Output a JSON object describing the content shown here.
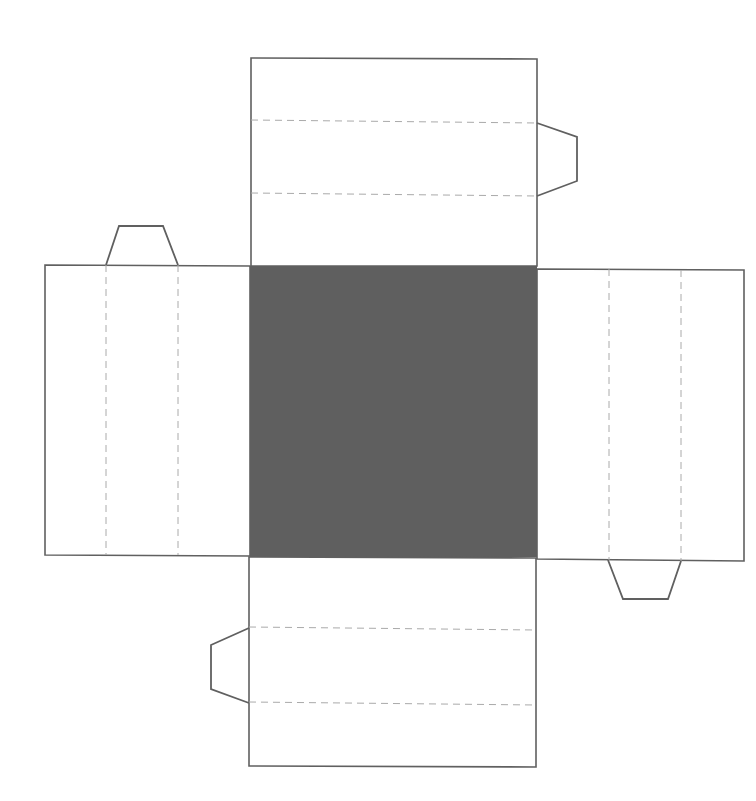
{
  "diagram": {
    "type": "box-net",
    "colors": {
      "outline": "#606060",
      "fold": "#aaaaaa",
      "base_fill": "#5f5f5f",
      "panel_fill": "#ffffff"
    },
    "base": {
      "x": 250,
      "y": 266,
      "w": 287,
      "h": 291
    },
    "panels": {
      "top": {
        "points": "251,58 537,59 537,266 251,266"
      },
      "bottom": {
        "points": "249,557 536,558 536,767 249,766"
      },
      "left": {
        "points": "45,265 250,266 250,556 45,555"
      },
      "right": {
        "points": "537,269 744,270 744,561 537,559"
      }
    },
    "folds": {
      "top": [
        "251,120 537,123",
        "251,193 537,196"
      ],
      "bottom": [
        "249,627 536,630",
        "249,702 536,705"
      ],
      "left": [
        "106,265 106,555",
        "178,265 178,555"
      ],
      "right": [
        "609,269 609,560",
        "681,270 681,561"
      ]
    },
    "tabs": {
      "top_right": "537,123 577,137 577,181 537,196",
      "left_top": "106,265 119,226 163,226 178,265",
      "right_bottom": "608,560 623,599 668,599 681,561",
      "bottom_left": "249,628 211,645 211,689 249,703"
    }
  }
}
